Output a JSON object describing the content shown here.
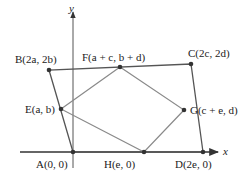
{
  "diagram": {
    "type": "geometry-coordinate-quadrilateral",
    "axes": {
      "x_label": "x",
      "y_label": "y",
      "origin": [
        73,
        152
      ],
      "x_axis": {
        "from": [
          20,
          152
        ],
        "to": [
          218,
          152
        ]
      },
      "y_axis": {
        "from": [
          73,
          168
        ],
        "to": [
          73,
          10
        ]
      }
    },
    "points": [
      {
        "id": "A",
        "label": "A(0, 0)",
        "pos": [
          73,
          152
        ],
        "label_pos": [
          36,
          168
        ]
      },
      {
        "id": "B",
        "label": "B(2a, 2b)",
        "pos": [
          49,
          70
        ],
        "label_pos": [
          15,
          61
        ]
      },
      {
        "id": "C",
        "label": "C(2c, 2d)",
        "pos": [
          191,
          64
        ],
        "label_pos": [
          188,
          55
        ]
      },
      {
        "id": "D",
        "label": "D(2e, 0)",
        "pos": [
          203,
          152
        ],
        "label_pos": [
          175,
          168
        ]
      },
      {
        "id": "E",
        "label": "E(a, b)",
        "pos": [
          61,
          109
        ],
        "label_pos": [
          25,
          113
        ]
      },
      {
        "id": "F",
        "label": "F(a + c, b + d)",
        "pos": [
          120,
          67
        ],
        "label_pos": [
          82,
          61
        ]
      },
      {
        "id": "G",
        "label": "G(c + e, d)",
        "pos": [
          184,
          110
        ],
        "label_pos": [
          190,
          114
        ]
      },
      {
        "id": "H",
        "label": "H(e, 0)",
        "pos": [
          144,
          152
        ],
        "label_pos": [
          104,
          168
        ]
      }
    ],
    "outer_quadrilateral": [
      "A",
      "B",
      "C",
      "D"
    ],
    "inner_quadrilateral": [
      "E",
      "F",
      "G",
      "H"
    ],
    "colors": {
      "outer": "#555555",
      "inner": "#8a8a8a",
      "axes": "#333333",
      "points": "#333333",
      "text": "#222222"
    }
  }
}
